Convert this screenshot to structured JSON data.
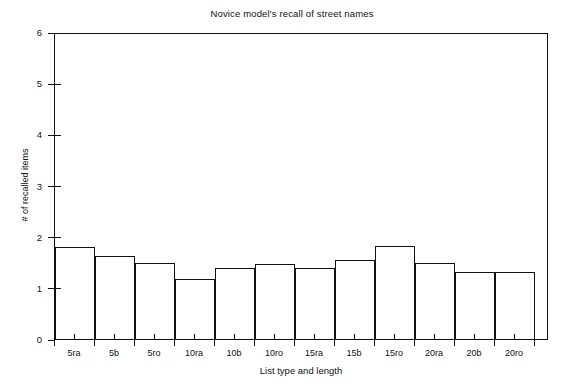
{
  "chart_data": {
    "type": "bar",
    "title": "Novice model's recall of street names",
    "xlabel": "List type and length",
    "ylabel": "# of recalled items",
    "categories": [
      "5ra",
      "5b",
      "5ro",
      "10ra",
      "10b",
      "10ro",
      "15ra",
      "15b",
      "15ro",
      "20ra",
      "20b",
      "20ro"
    ],
    "values": [
      1.8,
      1.63,
      1.49,
      1.18,
      1.38,
      1.46,
      1.38,
      1.54,
      1.81,
      1.49,
      1.31,
      1.31
    ],
    "ylim": [
      0,
      6
    ],
    "yticks": [
      0,
      1,
      2,
      3,
      4,
      5,
      6
    ],
    "ytick_labels": [
      "0",
      "1",
      "2",
      "3",
      "4",
      "5",
      "6"
    ],
    "grid": false,
    "legend": null,
    "series": [
      {
        "name": "Novice model recall",
        "values": [
          1.8,
          1.63,
          1.49,
          1.18,
          1.38,
          1.46,
          1.38,
          1.54,
          1.81,
          1.49,
          1.31,
          1.31
        ]
      }
    ],
    "bar_style": "outlined",
    "bar_fill": "#ffffff",
    "bar_edge": "#111111"
  },
  "figure": {
    "background": "#ffffff",
    "axis_color": "#111111"
  }
}
